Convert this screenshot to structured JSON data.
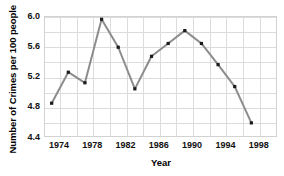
{
  "chart_data": {
    "type": "line",
    "title": "",
    "xlabel": "Year",
    "ylabel": "Number of Crimes per 100 people",
    "x": [
      1973,
      1975,
      1977,
      1979,
      1981,
      1983,
      1985,
      1987,
      1989,
      1991,
      1993,
      1995,
      1997,
      1999
    ],
    "values": [
      4.86,
      5.27,
      5.13,
      5.97,
      5.6,
      5.05,
      5.48,
      5.65,
      5.82,
      5.65,
      5.37,
      5.08,
      4.6,
      4.6
    ],
    "series": [
      {
        "name": "Number of Crimes per 100 people",
        "values": [
          4.86,
          5.27,
          5.13,
          5.97,
          5.6,
          5.05,
          5.48,
          5.65,
          5.82,
          5.65,
          5.37,
          5.08,
          4.6,
          4.6
        ]
      }
    ],
    "points": [
      {
        "x": 1973,
        "y": 4.86
      },
      {
        "x": 1975,
        "y": 5.27
      },
      {
        "x": 1977,
        "y": 5.13
      },
      {
        "x": 1979,
        "y": 5.97
      },
      {
        "x": 1981,
        "y": 5.6
      },
      {
        "x": 1983,
        "y": 5.05
      },
      {
        "x": 1985,
        "y": 5.48
      },
      {
        "x": 1987,
        "y": 5.65
      },
      {
        "x": 1989,
        "y": 5.82
      },
      {
        "x": 1991,
        "y": 5.65
      },
      {
        "x": 1993,
        "y": 5.37
      },
      {
        "x": 1995,
        "y": 5.08
      },
      {
        "x": 1997,
        "y": 4.6
      }
    ],
    "xlim": [
      1972.2,
      2000.2
    ],
    "ylim": [
      4.4,
      6.0
    ],
    "xticks": [
      1974,
      1978,
      1982,
      1986,
      1990,
      1994,
      1998
    ],
    "xtick_labels": [
      "1974",
      "1978",
      "1982",
      "1986",
      "1990",
      "1994",
      "1998"
    ],
    "yticks": [
      4.4,
      4.8,
      5.2,
      5.6,
      6.0
    ],
    "ytick_labels": [
      "4.4",
      "4.8",
      "5.2",
      "5.6",
      "6.0"
    ],
    "grid": true,
    "grid_color": "#dcdcdc",
    "legend": false,
    "legend_position": "none",
    "line_color": "#8c8c8c",
    "marker_color": "#1a1a1a",
    "marker_shape": "square",
    "background_color": "#ffffff",
    "axis_color": "#d2d2d2",
    "text_color": "#111111"
  }
}
